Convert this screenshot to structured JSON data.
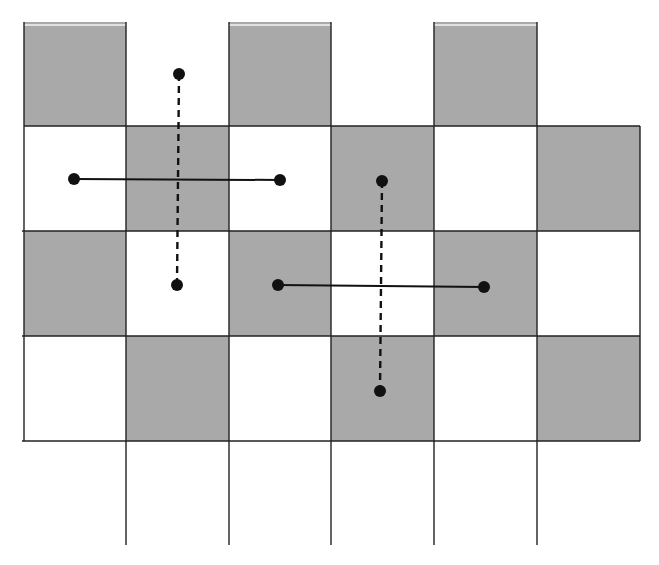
{
  "diagram": {
    "type": "checkerboard-grid-with-segments",
    "colors": {
      "shaded_cell": "#a9a9a9",
      "white_cell": "#ffffff",
      "grid_line": "#222222",
      "segment": "#111111",
      "highlight": "#f4f4f4"
    },
    "grid": {
      "col_edges": [
        24,
        126,
        229,
        331,
        434,
        537,
        640
      ],
      "row_edges": [
        22,
        126,
        231,
        336,
        441
      ],
      "vertical_line_bottom": 545,
      "horizontal_lines": [
        {
          "y": 126,
          "x1": 24,
          "x2": 640
        },
        {
          "y": 231,
          "x1": 22,
          "x2": 640
        },
        {
          "y": 336,
          "x1": 22,
          "x2": 640
        },
        {
          "y": 441,
          "x1": 22,
          "x2": 640
        }
      ],
      "shaded_cells": [
        {
          "col": 0,
          "row": 0
        },
        {
          "col": 2,
          "row": 0
        },
        {
          "col": 4,
          "row": 0
        },
        {
          "col": 1,
          "row": 1
        },
        {
          "col": 3,
          "row": 1
        },
        {
          "col": 5,
          "row": 1
        },
        {
          "col": 0,
          "row": 2
        },
        {
          "col": 2,
          "row": 2
        },
        {
          "col": 4,
          "row": 2
        },
        {
          "col": 1,
          "row": 3
        },
        {
          "col": 3,
          "row": 3
        },
        {
          "col": 5,
          "row": 3
        }
      ]
    },
    "segments": [
      {
        "name": "horizontal-segment-1",
        "style": "solid",
        "x1": 74,
        "y1": 179,
        "x2": 280,
        "y2": 180
      },
      {
        "name": "vertical-segment-1",
        "style": "dashed",
        "x1": 179,
        "y1": 74,
        "x2": 177,
        "y2": 285
      },
      {
        "name": "horizontal-segment-2",
        "style": "solid",
        "x1": 278,
        "y1": 285,
        "x2": 484,
        "y2": 287
      },
      {
        "name": "vertical-segment-2",
        "style": "dashed",
        "x1": 382,
        "y1": 181,
        "x2": 380,
        "y2": 391
      }
    ],
    "point_radius": 6
  }
}
